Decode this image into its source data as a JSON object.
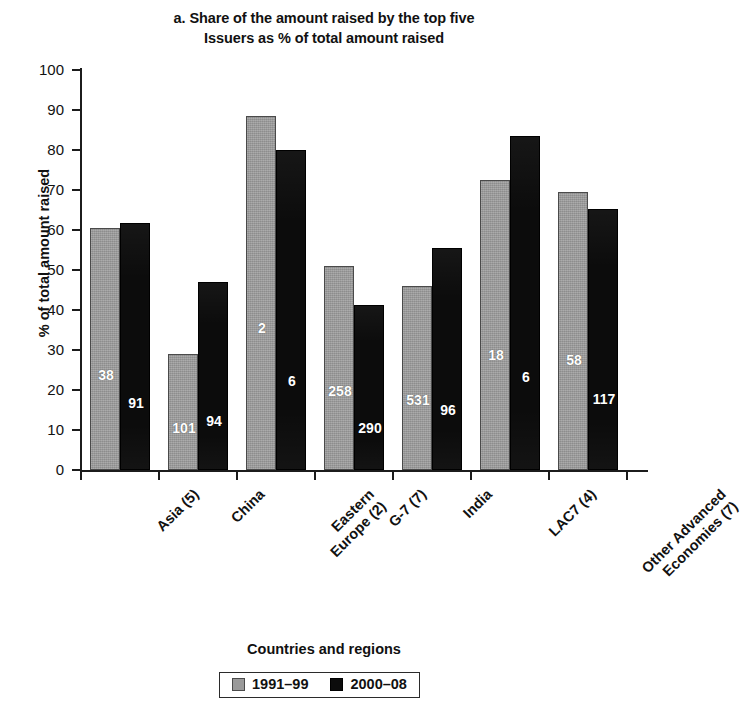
{
  "chart_data": {
    "type": "bar",
    "title": "a. Share of the amount raised by the top five Issuers as % of total amount raised",
    "title_lines": [
      "a. Share of the amount raised by the top five",
      "Issuers as % of total amount raised"
    ],
    "xlabel": "Countries and regions",
    "ylabel": "% of total amount raised",
    "ylim": [
      0,
      100
    ],
    "ytick_values": [
      0,
      10,
      20,
      30,
      40,
      50,
      60,
      70,
      80,
      90,
      100
    ],
    "ytick_labels": [
      "0",
      "10",
      "20",
      "30",
      "40",
      "50",
      "60",
      "70",
      "80",
      "90",
      "100"
    ],
    "grid": false,
    "legend_position": "bottom",
    "categories": [
      "Asia (5)",
      "China",
      "Eastern Europe (2)",
      "G-7 (7)",
      "India",
      "LAC7 (4)",
      "Other Advanced Economies (7)"
    ],
    "category_lines": [
      [
        "Asia (5)"
      ],
      [
        "China"
      ],
      [
        "Eastern",
        "Europe (2)"
      ],
      [
        "G-7 (7)"
      ],
      [
        "India"
      ],
      [
        "LAC7 (4)"
      ],
      [
        "Other Advanced",
        "Economies (7)"
      ]
    ],
    "series": [
      {
        "name": "1991–99",
        "color": "#9a9a9a",
        "values": [
          60.5,
          29.0,
          88.5,
          51.0,
          46.0,
          72.5,
          69.5
        ],
        "point_labels": [
          "38",
          "101",
          "2",
          "258",
          "531",
          "18",
          "58"
        ]
      },
      {
        "name": "2000–08",
        "color": "#0c0c0c",
        "values": [
          61.7,
          47.0,
          80.0,
          41.2,
          55.5,
          83.5,
          65.2
        ],
        "point_labels": [
          "91",
          "94",
          "6",
          "290",
          "96",
          "6",
          "117"
        ]
      }
    ]
  },
  "legend": {
    "items": [
      {
        "label": "1991–99",
        "swatch": "gray"
      },
      {
        "label": "2000–08",
        "swatch": "black"
      }
    ]
  }
}
